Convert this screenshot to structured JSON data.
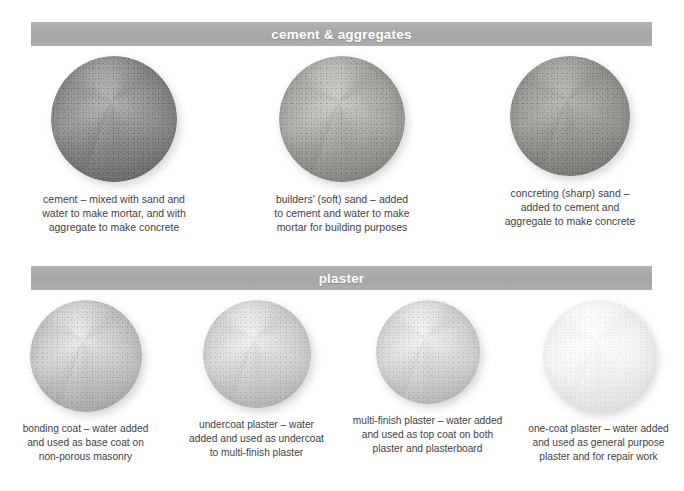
{
  "sections": [
    {
      "id": "cement",
      "title": "cement & aggregates",
      "items": [
        {
          "name": "cement-sample",
          "caption": "cement – mixed with sand and\nwater to make mortar, and with\naggregate to make concrete",
          "base_color": "#8e8e8e",
          "shadow_color": "#5e5e5e",
          "highlight_color": "#b9b9b9",
          "diameter": 126
        },
        {
          "name": "builders-soft-sand-sample",
          "caption": "builders' (soft) sand – added\nto cement and water to make\nmortar for building purposes",
          "base_color": "#a8a8a4",
          "shadow_color": "#76756f",
          "highlight_color": "#d2d2cd",
          "diameter": 126
        },
        {
          "name": "concreting-sharp-sand-sample",
          "caption": "concreting (sharp) sand –\nadded to cement and\naggregate to make concrete",
          "base_color": "#9a9a97",
          "shadow_color": "#6d6d6a",
          "highlight_color": "#bcbcb9",
          "diameter": 120
        }
      ]
    },
    {
      "id": "plaster",
      "title": "plaster",
      "items": [
        {
          "name": "bonding-coat-sample",
          "caption": "bonding coat – water added\nand used as base coat on\nnon-porous masonry",
          "base_color": "#c7c7c5",
          "shadow_color": "#9a9a98",
          "highlight_color": "#eeeeec",
          "diameter": 112
        },
        {
          "name": "undercoat-plaster-sample",
          "caption": "undercoat plaster – water\nadded and used as undercoat\nto multi-finish plaster",
          "base_color": "#d2d2d0",
          "shadow_color": "#a5a5a3",
          "highlight_color": "#f4f4f2",
          "diameter": 108
        },
        {
          "name": "multi-finish-plaster-sample",
          "caption": "multi-finish plaster – water added\nand used as top coat on both\nplaster and plasterboard",
          "base_color": "#d6d6d4",
          "shadow_color": "#a9a9a7",
          "highlight_color": "#f6f6f5",
          "diameter": 104
        },
        {
          "name": "one-coat-plaster-sample",
          "caption": "one-coat plaster – water added\nand used as general purpose\nplaster and for repair work",
          "base_color": "#f3f3f3",
          "shadow_color": "#d6d6d6",
          "highlight_color": "#ffffff",
          "diameter": 112
        }
      ]
    }
  ],
  "colors": {
    "bar_background": "#aaaaaa",
    "bar_text": "#ffffff",
    "caption_text": "#3f3f3f",
    "page_background": "#ffffff"
  }
}
